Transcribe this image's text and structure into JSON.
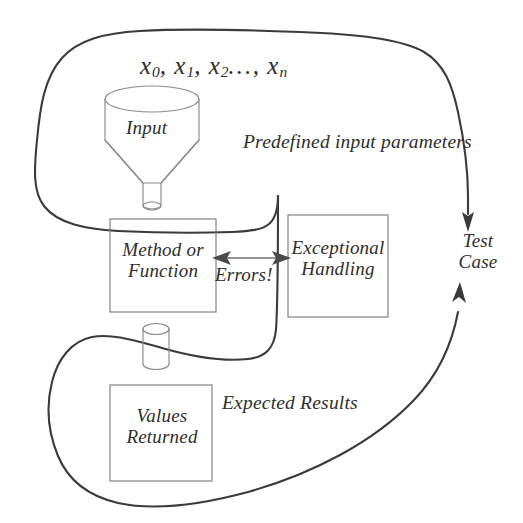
{
  "diagram": {
    "style": {
      "ink": "#3b3b3b",
      "box_stroke": "#7d7d7d",
      "background": "#ffffff"
    },
    "input_region": {
      "formula_x": "x",
      "formula_sub_0": "0",
      "formula_sub_1": "1",
      "formula_sub_2": "2",
      "formula_sub_n": "n",
      "formula_sep": ", ",
      "formula_dots": "…",
      "formula_plain": "x0, x1, x2,…, xn",
      "funnel_label": "Input",
      "region_label": "Predefined input parameters"
    },
    "boxes": [
      {
        "id": "method",
        "label": "Method or Function",
        "line1": "Method or",
        "line2": "Function"
      },
      {
        "id": "exceptional",
        "label": "Exceptional Handling",
        "line1": "Exceptional",
        "line2": "Handling"
      },
      {
        "id": "values",
        "label": "Values Returned",
        "line1": "Values",
        "line2": "Returned"
      }
    ],
    "connector": {
      "label": "Errors!",
      "kind": "double-headed-arrow"
    },
    "output_region": {
      "region_label": "Expected Results"
    },
    "test_case": {
      "line1": "Test",
      "line2": "Case",
      "label": "Test Case"
    }
  }
}
